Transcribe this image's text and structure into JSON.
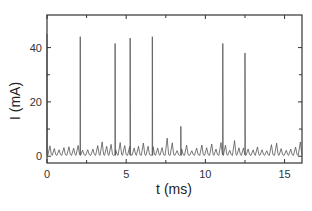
{
  "chart_data": {
    "type": "line",
    "title": "",
    "xlabel": "t (ms)",
    "ylabel": "I (mA)",
    "xlim": [
      0,
      16.1
    ],
    "ylim": [
      -2.5,
      52
    ],
    "x_ticks": [
      0,
      5,
      10,
      15
    ],
    "x_minor_ticks": [
      2.5,
      7.5,
      12.5
    ],
    "y_ticks": [
      0,
      20,
      40
    ],
    "y_minor_ticks": [
      10,
      30
    ],
    "grid": false,
    "legend": null,
    "line_color": "#555555",
    "baseline_oscillation": {
      "period_ms": 0.3,
      "peak_min_mA": 2,
      "peak_max_mA": 7,
      "baseline_mA": 0
    },
    "spikes": [
      {
        "t": 0.0,
        "I": 45
      },
      {
        "t": 2.1,
        "I": 44
      },
      {
        "t": 4.3,
        "I": 41.5
      },
      {
        "t": 5.25,
        "I": 43.5
      },
      {
        "t": 6.65,
        "I": 44
      },
      {
        "t": 8.45,
        "I": 11
      },
      {
        "t": 11.1,
        "I": 41.5
      },
      {
        "t": 12.5,
        "I": 38
      }
    ]
  },
  "axes": {
    "x_label": "t (ms)",
    "y_label": "I (mA)",
    "x_tick_labels": [
      "0",
      "5",
      "10",
      "15"
    ],
    "y_tick_labels": [
      "0",
      "20",
      "40"
    ]
  }
}
